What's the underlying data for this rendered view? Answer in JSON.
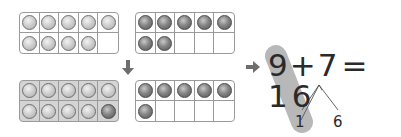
{
  "diagram": {
    "top_frames": [
      {
        "name": "nine",
        "balls": [
          "light",
          "light",
          "light",
          "light",
          "light",
          "light",
          "light",
          "light",
          "light",
          "empty"
        ],
        "shaded": false
      },
      {
        "name": "seven",
        "balls": [
          "dark",
          "dark",
          "dark",
          "dark",
          "dark",
          "dark",
          "dark",
          "empty",
          "empty",
          "empty"
        ],
        "shaded": false
      }
    ],
    "bottom_frames": [
      {
        "name": "ten",
        "balls": [
          "light",
          "light",
          "light",
          "light",
          "light",
          "light",
          "light",
          "light",
          "light",
          "dark"
        ],
        "shaded": true
      },
      {
        "name": "six",
        "balls": [
          "dark",
          "dark",
          "dark",
          "dark",
          "dark",
          "dark",
          "empty",
          "empty",
          "empty",
          "empty"
        ],
        "shaded": false
      }
    ],
    "equation": {
      "a": "9",
      "plus": "+",
      "b": "7",
      "equals": "=",
      "result": "16"
    },
    "decomposition": {
      "left": "1",
      "right": "6"
    },
    "icons": [
      "arrow-down-icon",
      "arrow-right-icon"
    ],
    "colors": {
      "highlight": "#b8b8b8",
      "frame_border": "#9a9a9a",
      "shaded_frame": "#d4d4d4",
      "text": "#2a2a2a"
    }
  }
}
